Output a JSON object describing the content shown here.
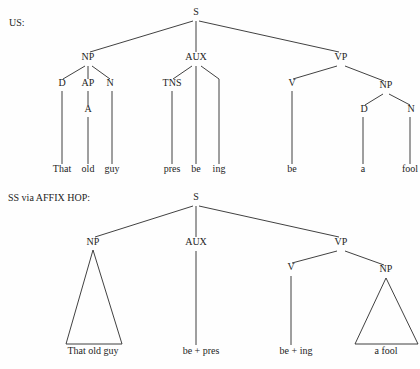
{
  "figure": {
    "background_color": "#fefefe",
    "ink_color": "#2b2b2b",
    "width": 420,
    "height": 369
  },
  "diagrams": [
    {
      "id": "us-tree",
      "caption": "US:",
      "caption_pos": {
        "x": 9,
        "y": 26
      },
      "nodes": [
        {
          "name": "s",
          "label": "S",
          "x": 196,
          "y": 15
        },
        {
          "name": "np",
          "label": "NP",
          "x": 88,
          "y": 60
        },
        {
          "name": "aux",
          "label": "AUX",
          "x": 196,
          "y": 60
        },
        {
          "name": "vp",
          "label": "VP",
          "x": 341,
          "y": 60
        },
        {
          "name": "d1",
          "label": "D",
          "x": 62,
          "y": 86
        },
        {
          "name": "ap",
          "label": "AP",
          "x": 88,
          "y": 86
        },
        {
          "name": "n1",
          "label": "N",
          "x": 110,
          "y": 86
        },
        {
          "name": "tns",
          "label": "TNS",
          "x": 172,
          "y": 86
        },
        {
          "name": "a",
          "label": "A",
          "x": 88,
          "y": 112
        },
        {
          "name": "v",
          "label": "V",
          "x": 292,
          "y": 86
        },
        {
          "name": "np2",
          "label": "NP",
          "x": 386,
          "y": 88
        },
        {
          "name": "d2",
          "label": "D",
          "x": 364,
          "y": 112
        },
        {
          "name": "n2",
          "label": "N",
          "x": 411,
          "y": 112
        }
      ],
      "leaves": [
        {
          "name": "leaf-that",
          "label": "That",
          "x": 62,
          "y": 172
        },
        {
          "name": "leaf-old",
          "label": "old",
          "x": 88,
          "y": 172
        },
        {
          "name": "leaf-guy",
          "label": "guy",
          "x": 112,
          "y": 172
        },
        {
          "name": "leaf-pres",
          "label": "pres",
          "x": 172,
          "y": 172
        },
        {
          "name": "leaf-be1",
          "label": "be",
          "x": 196,
          "y": 172
        },
        {
          "name": "leaf-ing",
          "label": "ing",
          "x": 219,
          "y": 172
        },
        {
          "name": "leaf-be2",
          "label": "be",
          "x": 292,
          "y": 172
        },
        {
          "name": "leaf-a",
          "label": "a",
          "x": 363,
          "y": 172
        },
        {
          "name": "leaf-fool",
          "label": "fool",
          "x": 410,
          "y": 172
        }
      ],
      "edges": [
        {
          "name": "edge-s-np",
          "x1": 193,
          "y1": 21,
          "x2": 90,
          "y2": 52
        },
        {
          "name": "edge-s-aux",
          "x1": 196,
          "y1": 21,
          "x2": 196,
          "y2": 52
        },
        {
          "name": "edge-s-vp",
          "x1": 199,
          "y1": 21,
          "x2": 339,
          "y2": 52
        },
        {
          "name": "edge-np-d",
          "x1": 85,
          "y1": 66,
          "x2": 63,
          "y2": 79
        },
        {
          "name": "edge-np-ap",
          "x1": 88,
          "y1": 66,
          "x2": 88,
          "y2": 79
        },
        {
          "name": "edge-np-n",
          "x1": 92,
          "y1": 66,
          "x2": 110,
          "y2": 79
        },
        {
          "name": "edge-ap-a",
          "x1": 88,
          "y1": 91,
          "x2": 88,
          "y2": 105
        },
        {
          "name": "edge-d1-leaf",
          "x1": 62,
          "y1": 91,
          "x2": 62,
          "y2": 164
        },
        {
          "name": "edge-a-leaf",
          "x1": 88,
          "y1": 117,
          "x2": 88,
          "y2": 164
        },
        {
          "name": "edge-n1-leaf",
          "x1": 112,
          "y1": 91,
          "x2": 112,
          "y2": 164
        },
        {
          "name": "edge-aux-tns",
          "x1": 192,
          "y1": 66,
          "x2": 173,
          "y2": 79
        },
        {
          "name": "edge-aux-be",
          "x1": 196,
          "y1": 66,
          "x2": 196,
          "y2": 79
        },
        {
          "name": "edge-aux-ing",
          "x1": 201,
          "y1": 66,
          "x2": 219,
          "y2": 79
        },
        {
          "name": "edge-tns-leaf",
          "x1": 172,
          "y1": 91,
          "x2": 172,
          "y2": 164
        },
        {
          "name": "edge-be1-leaf",
          "x1": 196,
          "y1": 79,
          "x2": 196,
          "y2": 164
        },
        {
          "name": "edge-ing-leaf",
          "x1": 219,
          "y1": 79,
          "x2": 219,
          "y2": 164
        },
        {
          "name": "edge-vp-v",
          "x1": 337,
          "y1": 66,
          "x2": 293,
          "y2": 79
        },
        {
          "name": "edge-vp-np",
          "x1": 345,
          "y1": 66,
          "x2": 384,
          "y2": 81
        },
        {
          "name": "edge-v-leaf",
          "x1": 292,
          "y1": 91,
          "x2": 292,
          "y2": 164
        },
        {
          "name": "edge-np2-d",
          "x1": 383,
          "y1": 94,
          "x2": 365,
          "y2": 105
        },
        {
          "name": "edge-np2-n",
          "x1": 389,
          "y1": 94,
          "x2": 410,
          "y2": 105
        },
        {
          "name": "edge-d2-leaf",
          "x1": 363,
          "y1": 117,
          "x2": 363,
          "y2": 164
        },
        {
          "name": "edge-n2-leaf",
          "x1": 410,
          "y1": 117,
          "x2": 410,
          "y2": 164
        }
      ],
      "triangles": []
    },
    {
      "id": "ss-affix-hop-tree",
      "caption": "SS via AFFIX HOP:",
      "caption_pos": {
        "x": 8,
        "y": 201
      },
      "nodes": [
        {
          "name": "s",
          "label": "S",
          "x": 196,
          "y": 200
        },
        {
          "name": "np",
          "label": "NP",
          "x": 93,
          "y": 245
        },
        {
          "name": "aux",
          "label": "AUX",
          "x": 196,
          "y": 245
        },
        {
          "name": "vp",
          "label": "VP",
          "x": 341,
          "y": 245
        },
        {
          "name": "v",
          "label": "V",
          "x": 291,
          "y": 270
        },
        {
          "name": "np2",
          "label": "NP",
          "x": 386,
          "y": 272
        }
      ],
      "leaves": [
        {
          "name": "leaf-that-old-guy",
          "label": "That old guy",
          "x": 93,
          "y": 354
        },
        {
          "name": "leaf-be-pres",
          "label": "be + pres",
          "x": 201,
          "y": 354
        },
        {
          "name": "leaf-be-ing",
          "label": "be + ing",
          "x": 296,
          "y": 354
        },
        {
          "name": "leaf-a-fool",
          "label": "a fool",
          "x": 386,
          "y": 354
        }
      ],
      "edges": [
        {
          "name": "edge-s-np",
          "x1": 193,
          "y1": 206,
          "x2": 95,
          "y2": 237
        },
        {
          "name": "edge-s-aux",
          "x1": 196,
          "y1": 206,
          "x2": 196,
          "y2": 237
        },
        {
          "name": "edge-s-vp",
          "x1": 199,
          "y1": 206,
          "x2": 339,
          "y2": 237
        },
        {
          "name": "edge-aux-leaf",
          "x1": 196,
          "y1": 251,
          "x2": 196,
          "y2": 345
        },
        {
          "name": "edge-vp-v",
          "x1": 337,
          "y1": 251,
          "x2": 292,
          "y2": 263
        },
        {
          "name": "edge-vp-np",
          "x1": 345,
          "y1": 251,
          "x2": 384,
          "y2": 265
        },
        {
          "name": "edge-v-leaf",
          "x1": 291,
          "y1": 276,
          "x2": 291,
          "y2": 345
        }
      ],
      "triangles": [
        {
          "name": "triangle-np-that-old-guy",
          "apex_x": 93,
          "apex_y": 250,
          "left_x": 66,
          "right_x": 122,
          "base_y": 344
        },
        {
          "name": "triangle-np-a-fool",
          "apex_x": 386,
          "apex_y": 278,
          "left_x": 355,
          "right_x": 418,
          "base_y": 344
        }
      ]
    }
  ]
}
